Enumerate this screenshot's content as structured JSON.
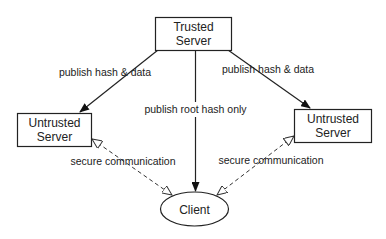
{
  "nodes": {
    "trusted_server": {
      "line1": "Trusted",
      "line2": "Server"
    },
    "untrusted_left": {
      "line1": "Untrusted",
      "line2": "Server"
    },
    "untrusted_right": {
      "line1": "Untrusted",
      "line2": "Server"
    },
    "client": {
      "label": "Client"
    }
  },
  "edges": {
    "publish_left": {
      "label": "publish hash & data",
      "style": "solid"
    },
    "publish_right": {
      "label": "publish hash & data",
      "style": "solid"
    },
    "publish_root": {
      "label": "publish root hash only",
      "style": "solid"
    },
    "secure_left": {
      "label": "secure communication",
      "style": "dashed-bidirectional"
    },
    "secure_right": {
      "label": "secure communication",
      "style": "dashed-bidirectional"
    }
  },
  "colors": {
    "stroke": "#222222",
    "background": "#ffffff"
  }
}
